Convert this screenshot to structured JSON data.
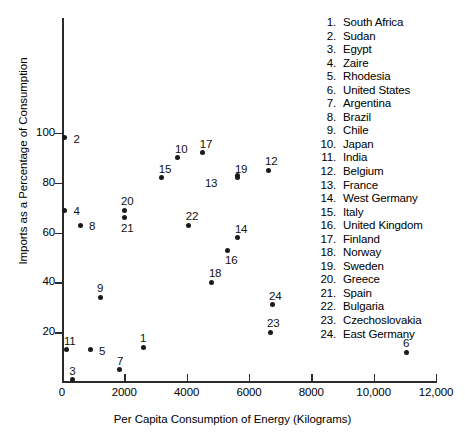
{
  "chart_data": {
    "type": "scatter",
    "title": "",
    "xlabel": "Per Capita Consumption of Energy (Kilograms)",
    "ylabel": "Imports as a Percentage of Consumption",
    "xlim": [
      0,
      12000
    ],
    "ylim": [
      0,
      110
    ],
    "xticks": [
      0,
      2000,
      4000,
      6000,
      8000,
      10000,
      12000
    ],
    "xtick_labels": [
      "0",
      "2000",
      "4000",
      "6000",
      "8000",
      "10,000",
      "12,000"
    ],
    "yticks": [
      20,
      40,
      60,
      80,
      100
    ],
    "ytick_labels": [
      "20",
      "40",
      "60",
      "80",
      "100"
    ],
    "grid": false,
    "legend_position": "right",
    "points": [
      {
        "id": 1,
        "name": "South Africa",
        "x": 2600,
        "y": 14,
        "label_dx": -3,
        "label_dy": -15
      },
      {
        "id": 2,
        "name": "Sudan",
        "x": 80,
        "y": 98,
        "label_dx": 9,
        "label_dy": -5
      },
      {
        "id": 3,
        "name": "Egypt",
        "x": 330,
        "y": 1,
        "label_dx": -3,
        "label_dy": -15
      },
      {
        "id": 4,
        "name": "Zaire",
        "x": 80,
        "y": 69,
        "label_dx": 9,
        "label_dy": -5
      },
      {
        "id": 5,
        "name": "Rhodesia",
        "x": 900,
        "y": 13,
        "label_dx": 9,
        "label_dy": -5
      },
      {
        "id": 6,
        "name": "United States",
        "x": 11040,
        "y": 12,
        "label_dx": -3,
        "label_dy": -15
      },
      {
        "id": 7,
        "name": "Argentina",
        "x": 1860,
        "y": 5,
        "label_dx": -3,
        "label_dy": -15
      },
      {
        "id": 8,
        "name": "Brazil",
        "x": 580,
        "y": 63,
        "label_dx": 9,
        "label_dy": -5
      },
      {
        "id": 9,
        "name": "Chile",
        "x": 1220,
        "y": 34,
        "label_dx": -3,
        "label_dy": -15
      },
      {
        "id": 10,
        "name": "Japan",
        "x": 3720,
        "y": 90,
        "label_dx": -3,
        "label_dy": -15
      },
      {
        "id": 11,
        "name": "India",
        "x": 160,
        "y": 13,
        "label_dx": -3,
        "label_dy": -15
      },
      {
        "id": 12,
        "name": "Belgium",
        "x": 6610,
        "y": 85,
        "label_dx": -3,
        "label_dy": -15
      },
      {
        "id": 13,
        "name": "France",
        "x": 5645,
        "y": 83,
        "label_dx": -33,
        "label_dy": 2
      },
      {
        "id": 14,
        "name": "West Germany",
        "x": 5645,
        "y": 58,
        "label_dx": -3,
        "label_dy": -15
      },
      {
        "id": 15,
        "name": "Italy",
        "x": 3200,
        "y": 82,
        "label_dx": -3,
        "label_dy": -15
      },
      {
        "id": 16,
        "name": "United Kingdom",
        "x": 5325,
        "y": 53,
        "label_dx": -3,
        "label_dy": 4
      },
      {
        "id": 17,
        "name": "Finland",
        "x": 4520,
        "y": 92,
        "label_dx": -3,
        "label_dy": -15
      },
      {
        "id": 18,
        "name": "Norway",
        "x": 4810,
        "y": 40,
        "label_dx": -3,
        "label_dy": -15
      },
      {
        "id": 19,
        "name": "Sweden",
        "x": 5645,
        "y": 82,
        "label_dx": -3,
        "label_dy": -15
      },
      {
        "id": 20,
        "name": "Greece",
        "x": 1990,
        "y": 69,
        "label_dx": -3,
        "label_dy": -15
      },
      {
        "id": 21,
        "name": "Spain",
        "x": 1990,
        "y": 66,
        "label_dx": -3,
        "label_dy": 4
      },
      {
        "id": 22,
        "name": "Bulgaria",
        "x": 4070,
        "y": 63,
        "label_dx": -3,
        "label_dy": -15
      },
      {
        "id": 23,
        "name": "Czechoslovakia",
        "x": 6675,
        "y": 20,
        "label_dx": -3,
        "label_dy": -15
      },
      {
        "id": 24,
        "name": "East Germany",
        "x": 6740,
        "y": 31,
        "label_dx": -3,
        "label_dy": -15
      }
    ]
  },
  "legend": {
    "entries": [
      {
        "num": "1.",
        "name": "South Africa"
      },
      {
        "num": "2.",
        "name": "Sudan"
      },
      {
        "num": "3.",
        "name": "Egypt"
      },
      {
        "num": "4.",
        "name": "Zaire"
      },
      {
        "num": "5.",
        "name": "Rhodesia"
      },
      {
        "num": "6.",
        "name": "United States"
      },
      {
        "num": "7.",
        "name": "Argentina"
      },
      {
        "num": "8.",
        "name": "Brazil"
      },
      {
        "num": "9.",
        "name": "Chile"
      },
      {
        "num": "10.",
        "name": "Japan"
      },
      {
        "num": "11.",
        "name": "India"
      },
      {
        "num": "12.",
        "name": "Belgium"
      },
      {
        "num": "13.",
        "name": "France"
      },
      {
        "num": "14.",
        "name": "West Germany"
      },
      {
        "num": "15.",
        "name": "Italy"
      },
      {
        "num": "16.",
        "name": "United Kingdom"
      },
      {
        "num": "17.",
        "name": "Finland"
      },
      {
        "num": "18.",
        "name": "Norway"
      },
      {
        "num": "19.",
        "name": "Sweden"
      },
      {
        "num": "20.",
        "name": "Greece"
      },
      {
        "num": "21.",
        "name": "Spain"
      },
      {
        "num": "22.",
        "name": "Bulgaria"
      },
      {
        "num": "23.",
        "name": "Czechoslovakia"
      },
      {
        "num": "24.",
        "name": "East Germany"
      }
    ]
  },
  "colors": {
    "point": "#1a1a1a",
    "axis": "#2b2b2b",
    "text": "#000000",
    "background": "#ffffff"
  }
}
